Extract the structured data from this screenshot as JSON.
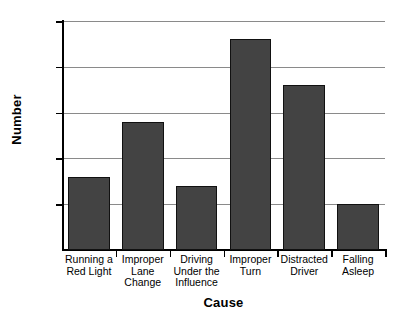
{
  "chart_data": {
    "type": "bar",
    "title": "",
    "xlabel": "Cause",
    "ylabel": "Number",
    "categories": [
      "Running a Red Light",
      "Improper Lane Change",
      "Driving Under the Influence",
      "Improper Turn",
      "Distracted Driver",
      "Falling Asleep"
    ],
    "category_lines": [
      [
        "Running a",
        "Red Light"
      ],
      [
        "Improper",
        "Lane",
        "Change"
      ],
      [
        "Driving",
        "Under the",
        "Influence"
      ],
      [
        "Improper",
        "Turn"
      ],
      [
        "Distracted",
        "Driver"
      ],
      [
        "Falling",
        "Asleep"
      ]
    ],
    "values": [
      8,
      14,
      7,
      23,
      18,
      5
    ],
    "ylim": [
      0,
      25
    ],
    "yticks": [
      0,
      5,
      10,
      15,
      20,
      25
    ],
    "ytick_labels": [
      "0",
      "5",
      "10",
      "15",
      "20",
      "25"
    ],
    "grid": true,
    "legend": false,
    "bar_color": "#434343",
    "bar_edge_color": "#111111",
    "gridline_color": "#8a8a8a",
    "axis_color": "#000000",
    "background_color": "#ffffff"
  }
}
